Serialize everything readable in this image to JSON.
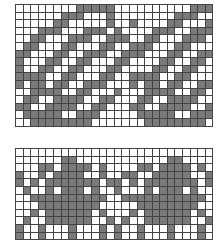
{
  "colors": {
    "filled": "#7a7a7a",
    "empty": "#ffffff",
    "grid": "#444444"
  },
  "charts": [
    {
      "name": "swirl-motif-chart",
      "cols": 26,
      "rows": [
        "00000000111110000000000111",
        "00000011100010000000011100",
        "00000110000010010000110001",
        "00011100011101000011100111",
        "00110001110011100110001110",
        "01100011000110011100011000",
        "11000110011100111000110011",
        "10001100110001100001100110",
        "10011001100011000011001100",
        "11110011000110011110011000",
        "10110110011100010110110011",
        "00111100110001000111100110",
        "01100111100110001100111100",
        "11001111001100011001111001",
        "01111100111000001111100111",
        "00111111110000000111111110"
      ]
    },
    {
      "name": "tree-motif-chart",
      "cols": 26,
      "rows": [
        "00000000000000000000000000",
        "00000011000000000000110000",
        "00011011110100001101111010",
        "10010111100100110011111001",
        "10101111111011010111111101",
        "01001011101001000101110100",
        "00111111111100111111111110",
        "00011111111000001111111100",
        "00101111110100010111111010",
        "01001111110010100111111001",
        "10010001000101001000100010",
        "10010001000101001000100010"
      ]
    }
  ]
}
